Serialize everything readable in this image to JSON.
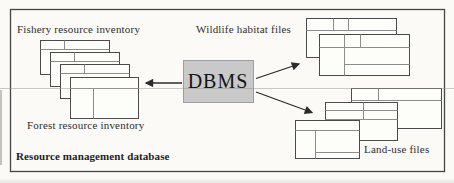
{
  "diagram": {
    "caption": "Resource management database",
    "dbms_label": "DBMS",
    "groups": {
      "fishery": {
        "label": "Fishery resource inventory"
      },
      "wildlife": {
        "label": "Wildlife habitat files"
      },
      "forest": {
        "label": "Forest resource inventory"
      },
      "landuse": {
        "label": "Land-use files"
      }
    },
    "colors": {
      "background": "#fbfaf6",
      "frame_border": "#454545",
      "card_border": "#4b4b4b",
      "card_fill": "#fdfdfa",
      "card_inner_line": "#8c8c8c",
      "dbms_fill": "#c9c9c9",
      "dbms_border": "#9e9e9e",
      "arrow": "#2b2b2b",
      "text": "#2e2e2e"
    }
  }
}
